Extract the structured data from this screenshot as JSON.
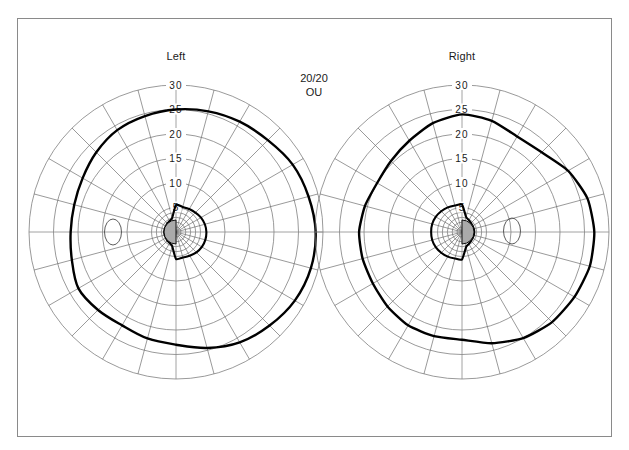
{
  "page": {
    "background_color": "#ffffff",
    "frame": {
      "border_color": "#8a8a8a",
      "x": 17,
      "y": 18,
      "width": 595,
      "height": 419
    }
  },
  "annotation": {
    "acuity_line1": "20/20",
    "acuity_line2": "OU"
  },
  "charts": [
    {
      "id": "left-eye",
      "title": "Left",
      "center": {
        "x": 176,
        "y": 232
      },
      "px_per_unit": 4.9,
      "ring_labels": [
        "30",
        "25",
        "20",
        "15",
        "10",
        "5"
      ],
      "ring_values": [
        30,
        25,
        20,
        15,
        10,
        5
      ],
      "spoke_step_deg": 15,
      "blind_spot": {
        "cx": 113,
        "cy": 232,
        "rx": 8.5,
        "ry": 13
      },
      "scotoma": {
        "cx": 176,
        "cy": 232,
        "r": 12,
        "side": "left",
        "fill": "#aaaaaa"
      }
    },
    {
      "id": "right-eye",
      "title": "Right",
      "center": {
        "x": 462,
        "y": 232
      },
      "px_per_unit": 4.9,
      "ring_labels": [
        "30",
        "25",
        "20",
        "15",
        "10",
        "5"
      ],
      "ring_values": [
        30,
        25,
        20,
        15,
        10,
        5
      ],
      "spoke_step_deg": 15,
      "blind_spot": {
        "cx": 512,
        "cy": 231,
        "rx": 8.5,
        "ry": 13
      },
      "scotoma": {
        "cx": 462,
        "cy": 232,
        "r": 12,
        "side": "right",
        "fill": "#aaaaaa"
      }
    }
  ],
  "chart_data": [
    {
      "type": "line",
      "subtype": "polar-isopter",
      "id": "left-eye",
      "title": "Left",
      "xlabel": "",
      "ylabel": "Eccentricity (degrees)",
      "rlim": [
        0,
        30
      ],
      "rticks": [
        5,
        10,
        15,
        20,
        25,
        30
      ],
      "grid": true,
      "legend": "none",
      "theta_unit": "degrees",
      "theta_convention": "0 = right (temporal-right on page), counterclockwise positive",
      "series": [
        {
          "name": "outer isopter",
          "theta": [
            0,
            15,
            30,
            45,
            60,
            75,
            90,
            105,
            120,
            135,
            150,
            165,
            180,
            195,
            210,
            225,
            240,
            255,
            270,
            285,
            300,
            315,
            330,
            345
          ],
          "r": [
            28.5,
            28.0,
            27.5,
            26.5,
            26.0,
            25.5,
            25.0,
            24.5,
            24.0,
            23.0,
            22.0,
            21.5,
            21.5,
            22.0,
            23.0,
            22.5,
            22.0,
            22.5,
            23.0,
            24.5,
            26.0,
            27.0,
            28.0,
            28.5
          ]
        },
        {
          "name": "inner isopter",
          "theta": [
            0,
            15,
            30,
            45,
            60,
            75,
            90,
            105,
            120,
            135,
            150,
            165,
            180,
            195,
            210,
            225,
            240,
            255,
            270,
            285,
            300,
            315,
            330,
            345
          ],
          "r": [
            6.2,
            6.1,
            5.9,
            5.6,
            5.4,
            5.3,
            5.5,
            3.0,
            2.6,
            2.5,
            2.4,
            2.4,
            2.4,
            2.4,
            2.4,
            2.5,
            2.6,
            3.0,
            5.5,
            5.4,
            5.6,
            5.9,
            6.1,
            6.2
          ]
        }
      ],
      "annotations": [
        {
          "kind": "blind-spot",
          "label": "",
          "theta_deg": 180,
          "r": 13,
          "rx_deg": 1.7,
          "ry_deg": 2.6
        },
        {
          "kind": "central-scotoma",
          "label": "",
          "r": 2.4,
          "half": "nasal-left",
          "fill": "#aaaaaa"
        }
      ]
    },
    {
      "type": "line",
      "subtype": "polar-isopter",
      "id": "right-eye",
      "title": "Right",
      "xlabel": "",
      "ylabel": "Eccentricity (degrees)",
      "rlim": [
        0,
        30
      ],
      "rticks": [
        5,
        10,
        15,
        20,
        25,
        30
      ],
      "grid": true,
      "legend": "none",
      "theta_unit": "degrees",
      "theta_convention": "0 = right (temporal-right on page), counterclockwise positive",
      "series": [
        {
          "name": "outer isopter",
          "theta": [
            0,
            15,
            30,
            45,
            60,
            75,
            90,
            105,
            120,
            135,
            150,
            165,
            180,
            195,
            210,
            225,
            240,
            255,
            270,
            285,
            300,
            315,
            330,
            345
          ],
          "r": [
            27.0,
            26.5,
            25.0,
            23.0,
            22.5,
            23.5,
            24.0,
            23.0,
            21.5,
            20.5,
            20.0,
            20.5,
            21.0,
            21.0,
            21.0,
            21.5,
            22.0,
            22.0,
            22.0,
            23.5,
            25.0,
            26.0,
            26.5,
            27.0
          ]
        },
        {
          "name": "inner isopter",
          "theta": [
            0,
            15,
            30,
            45,
            60,
            75,
            90,
            105,
            120,
            135,
            150,
            165,
            180,
            195,
            210,
            225,
            240,
            255,
            270,
            285,
            300,
            315,
            330,
            345
          ],
          "r": [
            2.5,
            2.5,
            2.5,
            2.6,
            2.8,
            3.2,
            5.6,
            5.6,
            5.8,
            6.0,
            6.2,
            6.3,
            6.3,
            6.3,
            6.2,
            6.0,
            5.8,
            5.6,
            5.6,
            3.2,
            2.8,
            2.6,
            2.5,
            2.5
          ]
        }
      ],
      "annotations": [
        {
          "kind": "blind-spot",
          "label": "",
          "theta_deg": 0,
          "r": 10.2,
          "rx_deg": 1.7,
          "ry_deg": 2.6
        },
        {
          "kind": "central-scotoma",
          "label": "",
          "r": 2.4,
          "half": "nasal-right",
          "fill": "#aaaaaa"
        }
      ]
    }
  ]
}
